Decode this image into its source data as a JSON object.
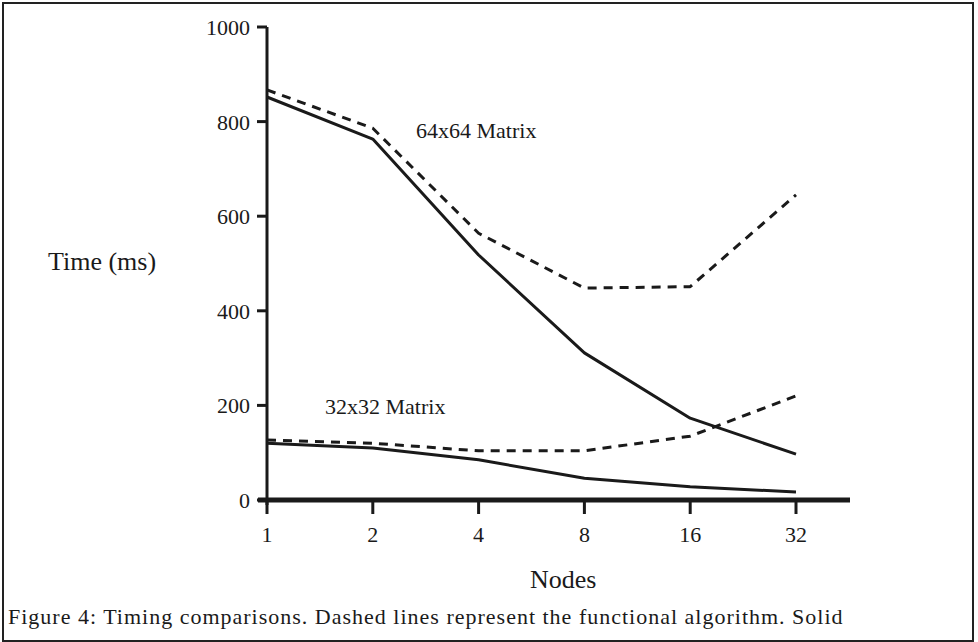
{
  "chart_data": {
    "type": "line",
    "title": "",
    "xlabel": "Nodes",
    "ylabel": "Time (ms)",
    "x": [
      1,
      2,
      4,
      8,
      16,
      32
    ],
    "categories": [
      "1",
      "2",
      "4",
      "8",
      "16",
      "32"
    ],
    "yticks": [
      0,
      200,
      400,
      600,
      800,
      1000
    ],
    "ylim": [
      0,
      1000
    ],
    "x_scale": "log2",
    "grid": false,
    "legend": "none (inline annotations)",
    "annotations": [
      {
        "text": "64x64 Matrix",
        "near": "upper series pair"
      },
      {
        "text": "32x32 Matrix",
        "near": "lower series pair"
      }
    ],
    "series": [
      {
        "name": "64x64 Matrix (solid)",
        "style": "solid",
        "values": [
          852,
          763,
          518,
          311,
          173,
          97
        ]
      },
      {
        "name": "64x64 Matrix (dashed)",
        "style": "dashed",
        "values": [
          867,
          786,
          564,
          448,
          451,
          645
        ]
      },
      {
        "name": "32x32 Matrix (solid)",
        "style": "solid",
        "values": [
          120,
          110,
          85,
          46,
          28,
          17
        ]
      },
      {
        "name": "32x32 Matrix (dashed)",
        "style": "dashed",
        "values": [
          127,
          120,
          104,
          104,
          135,
          220
        ]
      }
    ],
    "caption_partial": "Figure ... Each ... Dashed lines represent the functional algorithm. Solid ..."
  },
  "axes": {
    "y_title": "Time (ms)",
    "x_title": "Nodes",
    "y_ticks": [
      "0",
      "200",
      "400",
      "600",
      "800",
      "1000"
    ],
    "x_ticks": [
      "1",
      "2",
      "4",
      "8",
      "16",
      "32"
    ]
  },
  "labels": {
    "series_64": "64x64 Matrix",
    "series_32": "32x32 Matrix"
  },
  "caption": "Figure 4: Timing comparisons. Dashed lines represent the functional algorithm. Solid"
}
